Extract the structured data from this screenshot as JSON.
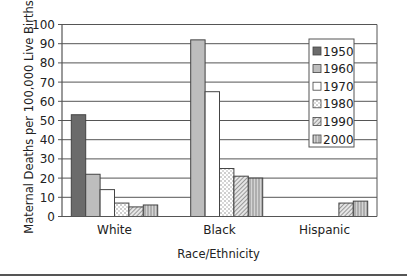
{
  "chart_data": {
    "type": "bar",
    "title": "",
    "xlabel": "Race/Ethnicity",
    "ylabel": "Maternal Deaths per 100,000 Live Births",
    "ylim": [
      0,
      100
    ],
    "yticks": [
      0,
      10,
      20,
      30,
      40,
      50,
      60,
      70,
      80,
      90,
      100
    ],
    "grid": true,
    "legend_position": "upper right (inside)",
    "categories": [
      "White",
      "Black",
      "Hispanic"
    ],
    "series": [
      {
        "name": "1950",
        "values": [
          53,
          null,
          null
        ],
        "fill": "#6b6b6b",
        "pattern": "solid"
      },
      {
        "name": "1960",
        "values": [
          22,
          92,
          null
        ],
        "fill": "#bdbdbd",
        "pattern": "solid"
      },
      {
        "name": "1970",
        "values": [
          14,
          65,
          null
        ],
        "fill": "#ffffff",
        "pattern": "solid"
      },
      {
        "name": "1980",
        "values": [
          7,
          25,
          null
        ],
        "fill": "#ffffff",
        "pattern": "dots"
      },
      {
        "name": "1990",
        "values": [
          5,
          21,
          7
        ],
        "fill": "#ffffff",
        "pattern": "diagonal"
      },
      {
        "name": "2000",
        "values": [
          6,
          20,
          8
        ],
        "fill": "#ffffff",
        "pattern": "vertical"
      }
    ]
  },
  "colors": {
    "axis": "#555555",
    "grid": "#555555",
    "bar_outline": "#444444",
    "bottom_rule": "#555555"
  }
}
